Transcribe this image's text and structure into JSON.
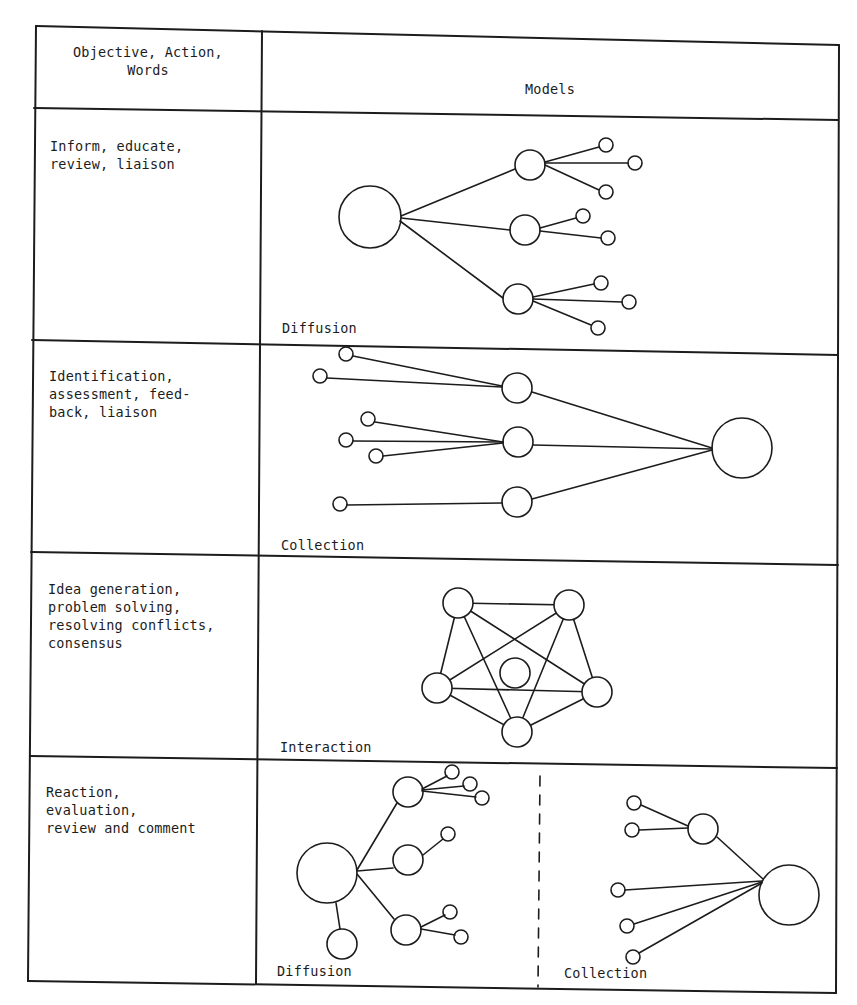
{
  "cropped_title": "",
  "table": {
    "header": {
      "col1": "Objective, Action,\nWords",
      "col2": "Models"
    },
    "rows": [
      {
        "objective": "Inform, educate,\nreview, liaison",
        "model_caption": "Diffusion"
      },
      {
        "objective": "Identification,\nassessment, feed-\nback, liaison",
        "model_caption": "Collection"
      },
      {
        "objective": "Idea generation,\nproblem solving,\nresolving conflicts,\nconsensus",
        "model_caption": "Interaction"
      },
      {
        "objective": "Reaction,\nevaluation,\nreview and comment",
        "model_caption_left": "Diffusion",
        "model_caption_right": "Collection"
      }
    ]
  },
  "colors": {
    "ink": "#1c1c1c",
    "paper": "#ffffff"
  }
}
